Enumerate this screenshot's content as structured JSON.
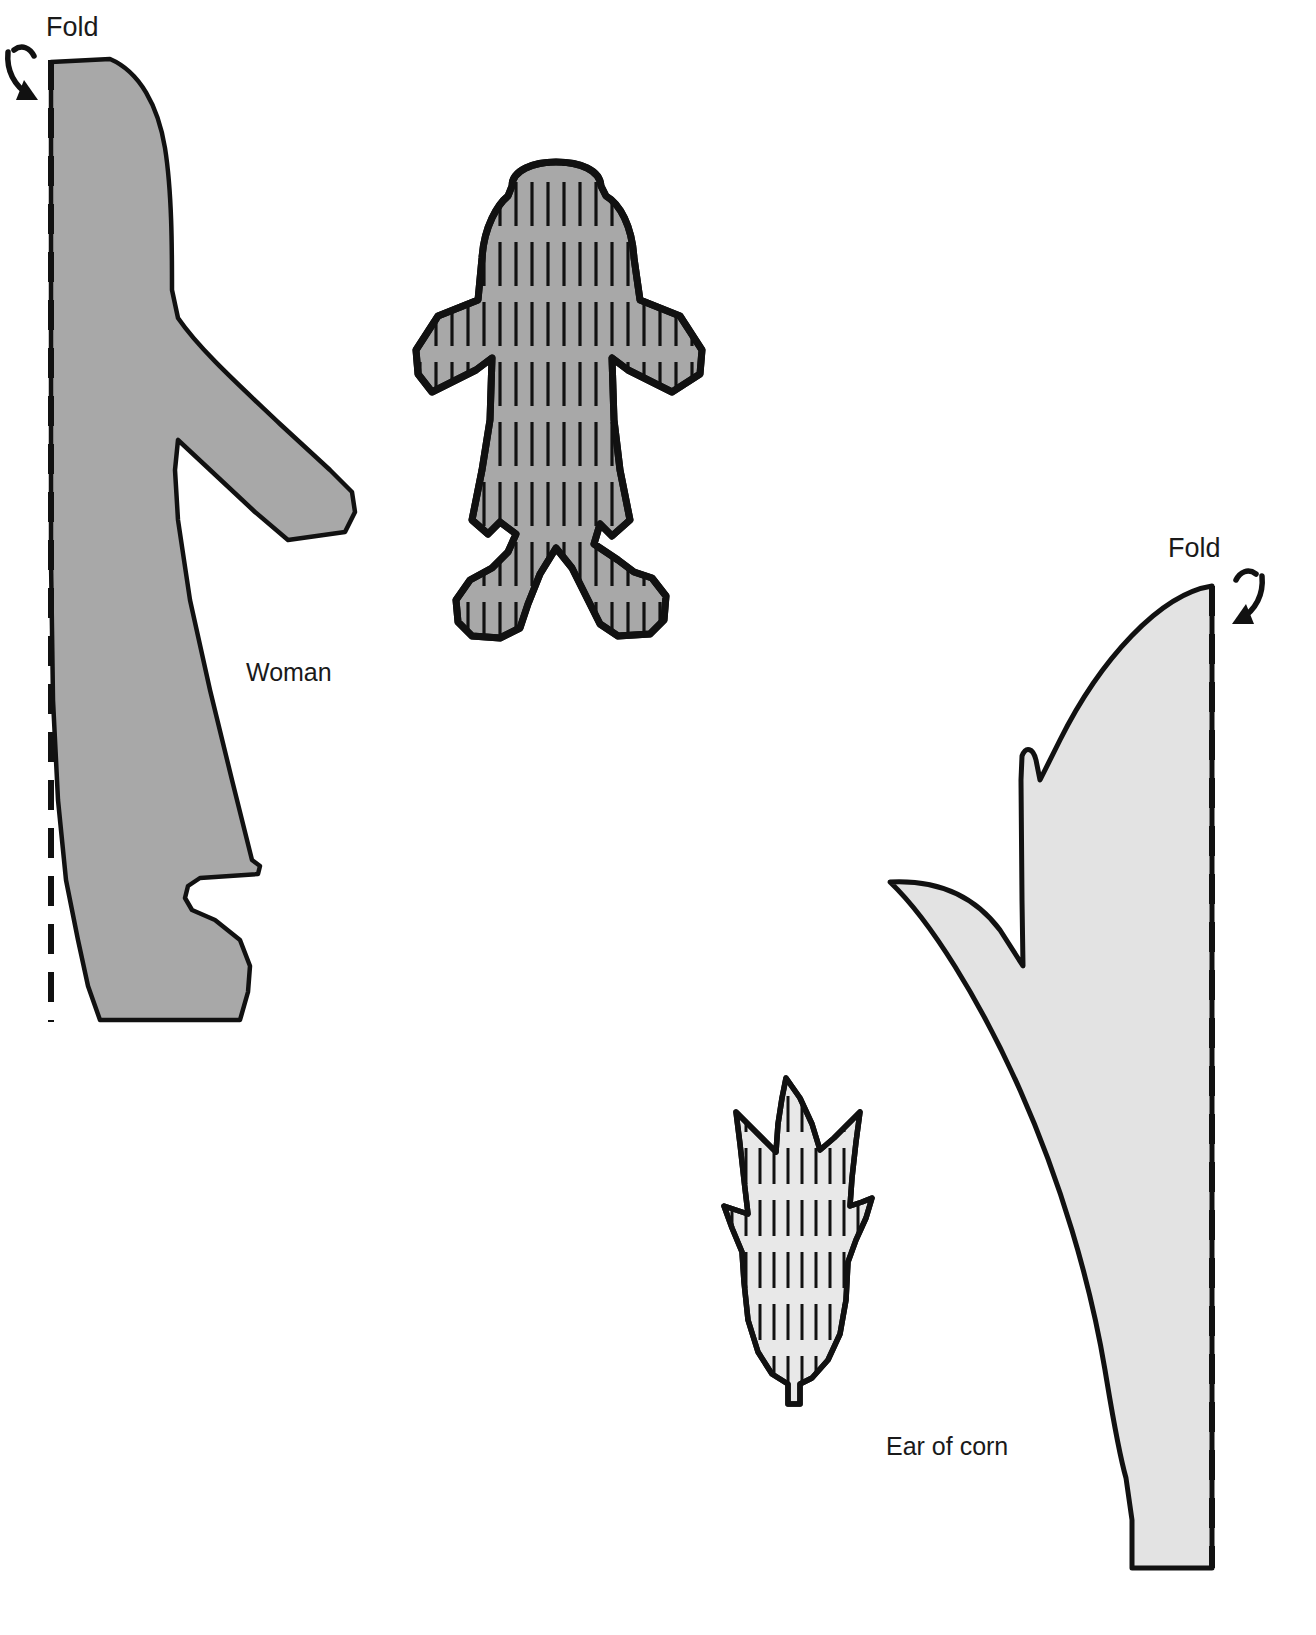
{
  "page": {
    "background_color": "#ffffff",
    "width": 1316,
    "height": 1635
  },
  "colors": {
    "outline": "#111111",
    "woman_fill": "#a8a8a8",
    "doll_fill": "#a8a8a8",
    "corn_leaf_fill": "#e3e3e3",
    "ear_fill": "#e8e8e8",
    "text": "#1a1a1a",
    "fold_line": "#111111"
  },
  "labels": {
    "fold_left": "Fold",
    "fold_right": "Fold",
    "woman": "Woman",
    "ear_of_corn": "Ear of corn"
  },
  "shapes": [
    {
      "id": "woman-pattern",
      "name": "woman",
      "label": "Woman",
      "fill": "#a8a8a8",
      "fold_edge": "left",
      "fold_line_dashed": true
    },
    {
      "id": "doll-figure",
      "name": "corn-husk-doll",
      "label": "",
      "fill": "#a8a8a8",
      "texture": "vertical-lines",
      "fold_edge": "none"
    },
    {
      "id": "corn-leaf-pattern",
      "name": "corn-leaf",
      "label": "",
      "fill": "#e3e3e3",
      "fold_edge": "right",
      "fold_line_dashed": true
    },
    {
      "id": "ear-of-corn",
      "name": "ear-of-corn",
      "label": "Ear of corn",
      "fill": "#e8e8e8",
      "texture": "vertical-lines",
      "fold_edge": "none"
    }
  ],
  "arrows": [
    {
      "id": "fold-arrow-left",
      "name": "fold-arrow-left",
      "direction": "curves-down-right"
    },
    {
      "id": "fold-arrow-right",
      "name": "fold-arrow-right",
      "direction": "curves-down-left"
    }
  ]
}
